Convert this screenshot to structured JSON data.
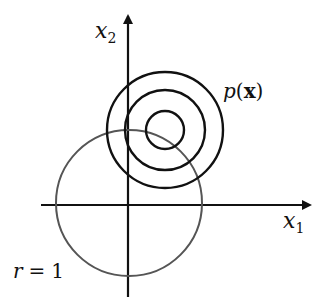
{
  "diagram": {
    "axes": {
      "x_label": "x",
      "x_sub": "1",
      "y_label": "x",
      "y_sub": "2"
    },
    "unit_circle": {
      "label_var": "r",
      "label_eq": "=",
      "label_val": "1",
      "color": "#555555"
    },
    "density": {
      "label_p": "p",
      "label_open": "(",
      "label_x": "x",
      "label_close": ")",
      "contour_count": 3,
      "color": "#111111"
    }
  }
}
